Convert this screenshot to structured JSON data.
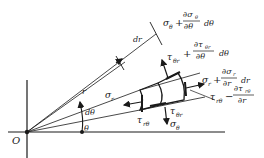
{
  "diagram": {
    "origin_label": "O",
    "radius_label": "r",
    "dr_label": "dr",
    "theta_label": "θ",
    "dtheta_label": "dθ",
    "stresses": {
      "sigma_r": "σ",
      "sigma_r_sub": "r",
      "tau_r_theta": "τ",
      "tau_r_theta_sub": "rθ",
      "sigma_theta": "σ",
      "sigma_theta_sub": "θ",
      "tau_theta_r": "τ",
      "tau_theta_r_sub": "θr",
      "tau_theta_r_top": "τ",
      "tau_theta_r_top_sub": "θr"
    },
    "expressions": {
      "sigma_theta_plus": {
        "base": "σ",
        "base_sub": "θ",
        "plus": "+",
        "num": "∂σ",
        "num_sub": "θ",
        "den": "∂θ",
        "tail": "dθ"
      },
      "tau_theta_r_plus": {
        "plus": "+",
        "num": "∂τ",
        "num_sub": "θr",
        "den": "∂θ",
        "tail": "dθ"
      },
      "sigma_r_plus": {
        "base": "σ",
        "base_sub": "r",
        "plus": "+",
        "num": "∂σ",
        "num_sub": "r",
        "den": "∂r",
        "tail": "dr"
      },
      "tau_r_theta_minus": {
        "base": "τ",
        "base_sub": "rθ",
        "minus": "−",
        "num": "∂τ",
        "num_sub": "rθ",
        "den": "∂r"
      }
    }
  }
}
